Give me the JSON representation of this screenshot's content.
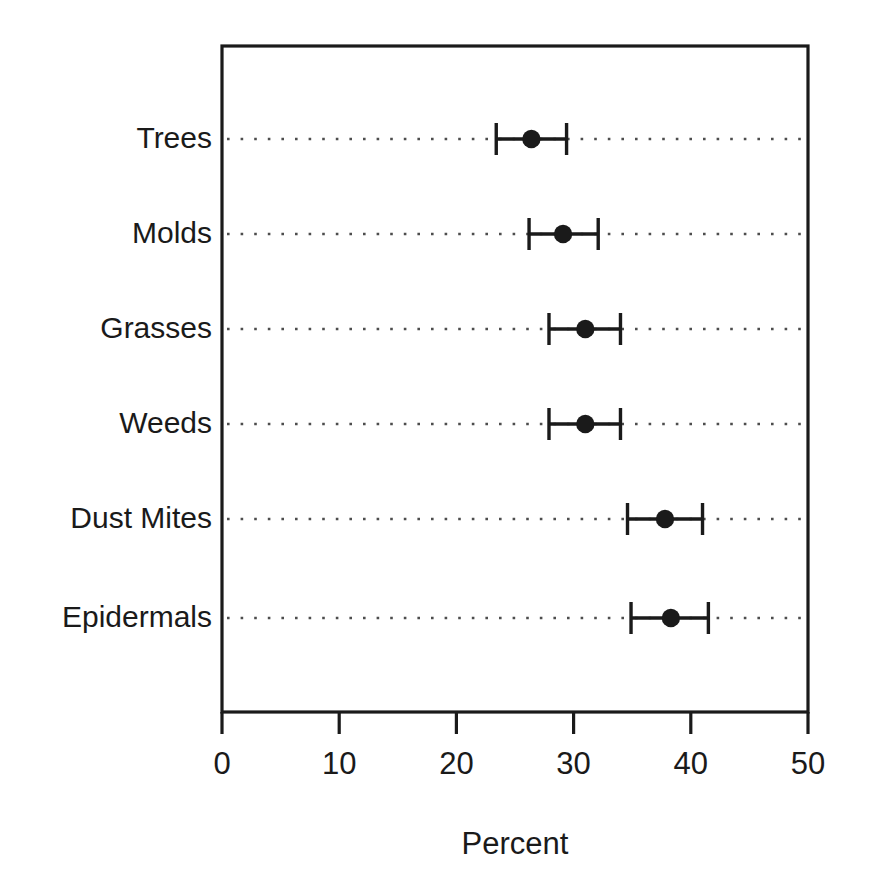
{
  "chart_data": {
    "type": "scatter",
    "orientation": "horizontal",
    "title": "",
    "subtitle": "",
    "xlabel": "Percent",
    "ylabel": "",
    "xlim": [
      0,
      50
    ],
    "xticks": [
      0,
      10,
      20,
      30,
      40,
      50
    ],
    "xtick_labels": [
      "0",
      "10",
      "20",
      "30",
      "40",
      "50"
    ],
    "grid": "horizontal-dotted",
    "legend": "none",
    "marker": "filled-circle",
    "error_bars": "horizontal-with-caps",
    "categories": [
      "Trees",
      "Molds",
      "Grasses",
      "Weeds",
      "Dust Mites",
      "Epidermals"
    ],
    "values": [
      26.4,
      29.1,
      31.0,
      31.0,
      37.8,
      38.3
    ],
    "ci_low": [
      23.4,
      26.2,
      27.9,
      27.9,
      34.6,
      34.9
    ],
    "ci_high": [
      29.4,
      32.1,
      34.0,
      34.0,
      41.0,
      41.5
    ],
    "points": [
      {
        "category": "Trees",
        "value": 26.4,
        "ci_low": 23.4,
        "ci_high": 29.4
      },
      {
        "category": "Molds",
        "value": 29.1,
        "ci_low": 26.2,
        "ci_high": 32.1
      },
      {
        "category": "Grasses",
        "value": 31.0,
        "ci_low": 27.9,
        "ci_high": 34.0
      },
      {
        "category": "Weeds",
        "value": 31.0,
        "ci_low": 27.9,
        "ci_high": 34.0
      },
      {
        "category": "Dust Mites",
        "value": 37.8,
        "ci_low": 34.6,
        "ci_high": 41.0
      },
      {
        "category": "Epidermals",
        "value": 38.3,
        "ci_low": 34.9,
        "ci_high": 41.5
      }
    ],
    "colors": {
      "marker": "#1a1a1a",
      "error_bar": "#1a1a1a",
      "axis": "#1a1a1a",
      "grid": "#4d4d4d",
      "background": "#ffffff",
      "text": "#1a1a1a"
    }
  },
  "geometry": {
    "plot_left": 222,
    "plot_right": 808,
    "plot_top": 46,
    "plot_bottom": 712,
    "row_y": [
      139,
      234,
      329,
      424,
      519,
      618
    ],
    "label_right_x": 212,
    "tick_label_y": 748,
    "axis_title_x": 515,
    "axis_title_y": 828
  }
}
